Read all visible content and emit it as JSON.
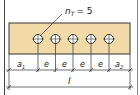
{
  "diagram": {
    "hole_label": "n",
    "hole_label_sub": "T",
    "hole_count_text": "= 5",
    "hole_count": 5,
    "dims": {
      "a1": "a",
      "a1_sub": "1",
      "e": "e",
      "a2": "a",
      "a2_sub": "2",
      "length": "l"
    },
    "colors": {
      "beam_fill": "#f2d9a8",
      "line": "#333333",
      "hole_fill": "#ffffff"
    }
  }
}
